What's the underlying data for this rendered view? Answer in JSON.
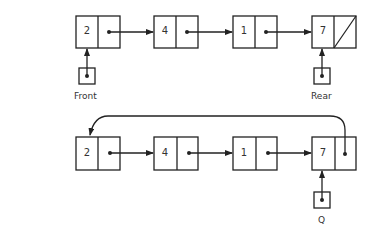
{
  "diagram": {
    "top": {
      "nodes": [
        {
          "value": "2",
          "next": "pointer"
        },
        {
          "value": "4",
          "next": "pointer"
        },
        {
          "value": "1",
          "next": "pointer"
        },
        {
          "value": "7",
          "next": "null"
        }
      ],
      "pointers": {
        "front": "Front",
        "rear": "Rear"
      }
    },
    "bottom": {
      "nodes": [
        {
          "value": "2",
          "next": "pointer"
        },
        {
          "value": "4",
          "next": "pointer"
        },
        {
          "value": "1",
          "next": "pointer"
        },
        {
          "value": "7",
          "next": "pointer-to-first"
        }
      ],
      "pointers": {
        "q": "Q"
      }
    },
    "colors": {
      "line": "#222222",
      "background": "#ffffff"
    }
  }
}
